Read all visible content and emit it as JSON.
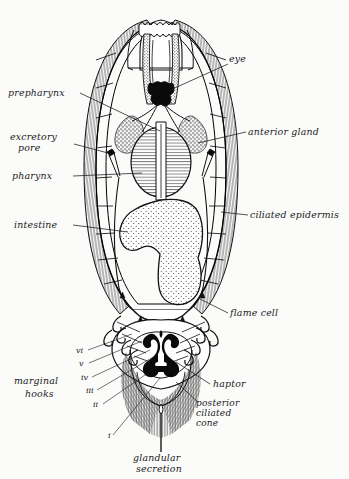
{
  "figure": {
    "organism": "monogenean trematode (ventral view)",
    "background_color": "#fbfbfa",
    "ink_color": "#111111",
    "style": "black-and-white stippled line drawing"
  },
  "labels": {
    "eye": "eye",
    "prepharynx": "prepharynx",
    "anterior_gland": "anterior gland",
    "excretory_pore": "excretory\npore",
    "excretory_pore_line1": "excretory",
    "excretory_pore_line2": "pore",
    "pharynx": "pharynx",
    "intestine": "intestine",
    "ciliated_epidermis": "ciliated epidermis",
    "flame_cell": "flame cell",
    "haptor": "haptor",
    "marginal_hooks_line1": "marginal",
    "marginal_hooks_line2": "hooks",
    "posterior_ciliated_cone_line1": "posterior",
    "posterior_ciliated_cone_line2": "ciliated",
    "posterior_ciliated_cone_line3": "cone",
    "glandular_secretion_line1": "glandular",
    "glandular_secretion_line2": "secretion"
  },
  "hook_numerals": [
    "vi",
    "v",
    "iv",
    "iii",
    "ii",
    "i"
  ],
  "structures": [
    {
      "name": "eye",
      "description": "paired black pigment mass, cross-shaped, anterior midline"
    },
    {
      "name": "prepharynx",
      "description": "narrow tube running from mouth to pharynx"
    },
    {
      "name": "anterior gland",
      "description": "paired granular cell clusters flanking the pharynx"
    },
    {
      "name": "excretory pore",
      "description": "paired lateral openings with short ducts"
    },
    {
      "name": "pharynx",
      "description": "oval muscular organ with horizontal striations"
    },
    {
      "name": "intestine",
      "description": "stippled inverted-Y caecum filling the mid-body"
    },
    {
      "name": "ciliated epidermis",
      "description": "hatched fringe along the whole body margin"
    },
    {
      "name": "flame cell",
      "description": "small solid triangles of the protonephridial system"
    },
    {
      "name": "haptor",
      "description": "posterior attachment organ bearing hooks"
    },
    {
      "name": "marginal hooks",
      "description": "six pairs of small curved hooks numbered i to vi"
    },
    {
      "name": "posterior ciliated cone",
      "description": "hatched fringed cone at the posterior tip"
    },
    {
      "name": "glandular secretion",
      "description": "droplet emerging at the posterior midline"
    }
  ]
}
